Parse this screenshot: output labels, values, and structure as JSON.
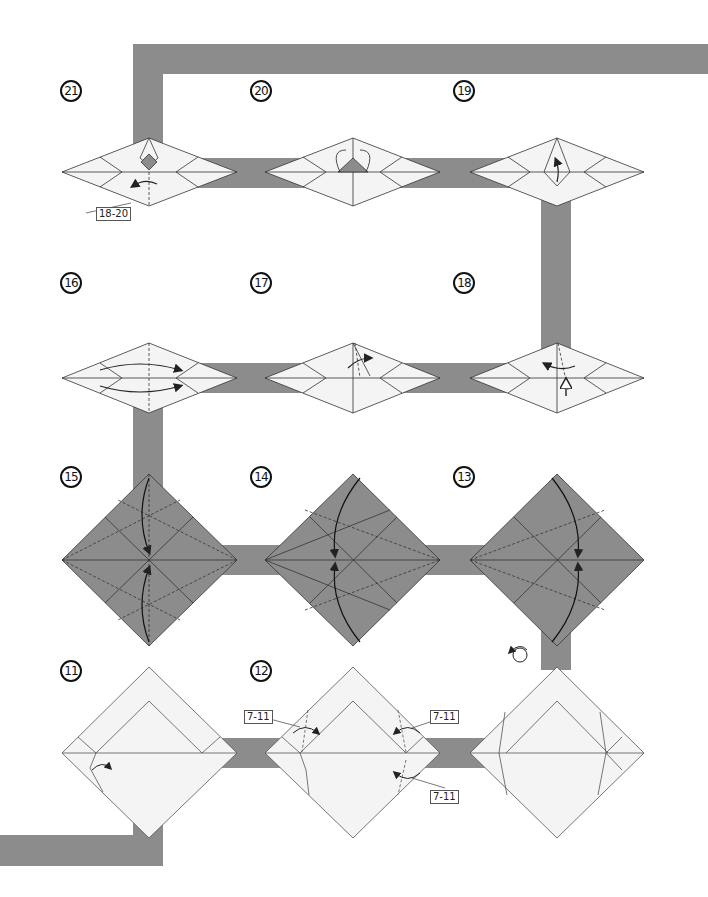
{
  "colors": {
    "path": "#8c8c8c",
    "paper_white": "#f4f4f4",
    "paper_colored": "#8c8c8c",
    "line": "#333333",
    "crease_dash": "#444444"
  },
  "steps": [
    {
      "number": "21",
      "x": 60,
      "y": 80,
      "ref_label": "18-20"
    },
    {
      "number": "20",
      "x": 250,
      "y": 80
    },
    {
      "number": "19",
      "x": 453,
      "y": 80
    },
    {
      "number": "16",
      "x": 60,
      "y": 272
    },
    {
      "number": "17",
      "x": 250,
      "y": 272
    },
    {
      "number": "18",
      "x": 453,
      "y": 272
    },
    {
      "number": "15",
      "x": 60,
      "y": 466
    },
    {
      "number": "14",
      "x": 250,
      "y": 466
    },
    {
      "number": "13",
      "x": 453,
      "y": 466
    },
    {
      "number": "11",
      "x": 60,
      "y": 660
    },
    {
      "number": "12",
      "x": 250,
      "y": 660,
      "ref_labels": [
        "7-11",
        "7-11",
        "7-11"
      ]
    }
  ],
  "labels": {
    "step21_ref": "18-20",
    "step12_ref_left": "7-11",
    "step12_ref_right": "7-11",
    "step12_ref_bottom": "7-11"
  },
  "icons": {
    "turn_over": "turn-over-icon"
  }
}
